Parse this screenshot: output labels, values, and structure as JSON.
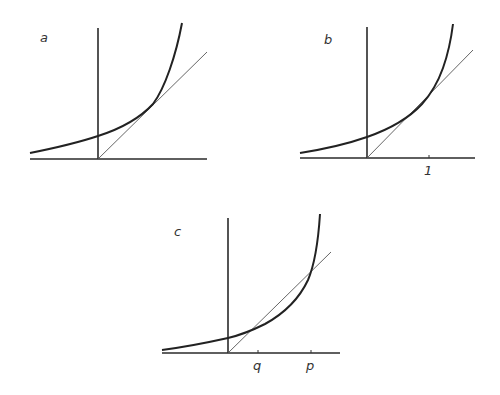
{
  "figure": {
    "panels": [
      {
        "id": "a",
        "label": "a",
        "tick_labels": []
      },
      {
        "id": "b",
        "label": "b",
        "tick_labels": [
          "1"
        ]
      },
      {
        "id": "c",
        "label": "c",
        "tick_labels": [
          "q",
          "p"
        ]
      }
    ]
  },
  "colors": {
    "curve": "#222222",
    "axis": "#2a2a2a",
    "line": "#555555",
    "background": "#ffffff"
  }
}
